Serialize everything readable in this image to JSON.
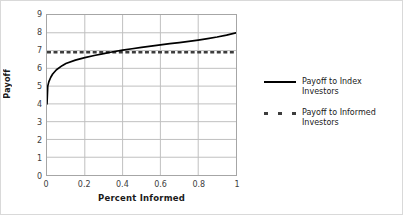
{
  "chart_data": {
    "type": "line",
    "title": "",
    "xlabel": "Percent Informed",
    "ylabel": "Payoff",
    "xlim": [
      0,
      1
    ],
    "ylim": [
      0,
      9
    ],
    "xticks": [
      "0",
      "0.2",
      "0.4",
      "0.6",
      "0.8",
      "1"
    ],
    "xtick_values": [
      0,
      0.2,
      0.4,
      0.6,
      0.8,
      1
    ],
    "yticks": [
      "0",
      "1",
      "2",
      "3",
      "4",
      "5",
      "6",
      "7",
      "8",
      "9"
    ],
    "ytick_values": [
      0,
      1,
      2,
      3,
      4,
      5,
      6,
      7,
      8,
      9
    ],
    "grid": true,
    "legend_position": "right",
    "series": [
      {
        "name": "Payoff to Index Investors",
        "style": "solid",
        "color": "#000000",
        "x": [
          0,
          0.004,
          0.01,
          0.02,
          0.03,
          0.05,
          0.08,
          0.1,
          0.15,
          0.2,
          0.25,
          0.3,
          0.33,
          0.35,
          0.4,
          0.45,
          0.5,
          0.55,
          0.6,
          0.65,
          0.7,
          0.75,
          0.8,
          0.85,
          0.9,
          0.95,
          1
        ],
        "y": [
          4.0,
          5.0,
          5.25,
          5.5,
          5.68,
          5.92,
          6.15,
          6.27,
          6.46,
          6.6,
          6.72,
          6.83,
          6.89,
          6.93,
          7.02,
          7.1,
          7.18,
          7.25,
          7.32,
          7.39,
          7.45,
          7.52,
          7.59,
          7.67,
          7.76,
          7.87,
          8.0
        ]
      },
      {
        "name": "Payoff to Informed Investors",
        "style": "dashed",
        "color": "#3d3d3d",
        "x": [
          0,
          1
        ],
        "y": [
          6.9,
          6.9
        ]
      }
    ],
    "annotations": [
      "Solid curve rises steeply from 4.0 at x=0 to about 5.0, then increases concavely to 8.0 at x=1.",
      "Dashed horizontal reference line is constant at approximately 6.9.",
      "The two series cross at approximately x=0.33."
    ]
  },
  "legend": {
    "entries": [
      {
        "label": "Payoff to Index Investors",
        "style": "solid"
      },
      {
        "label": "Payoff to Informed Investors",
        "style": "dashed"
      }
    ]
  },
  "colors": {
    "index_series": "#000000",
    "informed_series": "#3d3d3d",
    "gridline": "#bfbfbf",
    "axis": "#a6a6a6",
    "text": "#404040",
    "title_text": "#1a1a1a",
    "background": "#ffffff"
  }
}
